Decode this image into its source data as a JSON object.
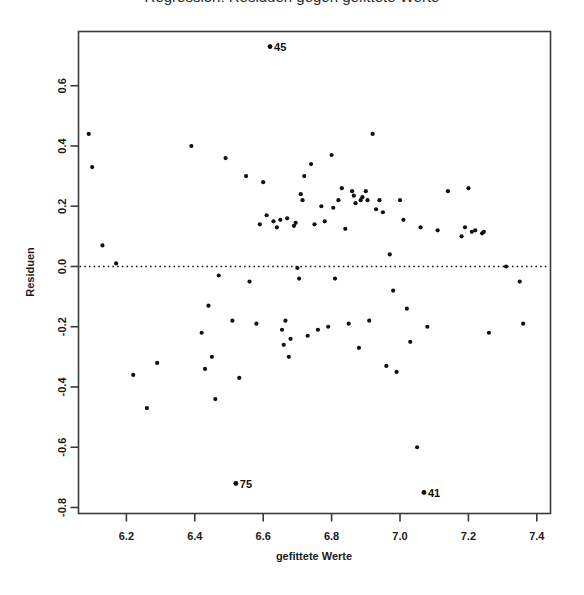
{
  "figure": {
    "title_partial": "Regression: Residuen gegen gefittete Werte",
    "title_cropped": true,
    "background_color": "#ffffff",
    "frame_color": "#3a3a3a",
    "point_color": "#111111",
    "refline_color": "#1a1a1a"
  },
  "chart_data": {
    "type": "scatter",
    "title": "Regression: Residuen gegen gefittete Werte",
    "xlabel": "gefittete Werte",
    "ylabel": "Residuen",
    "xlim": [
      6.06,
      7.44
    ],
    "ylim": [
      -0.82,
      0.78
    ],
    "xticks": [
      6.2,
      6.4,
      6.6,
      6.8,
      7.0,
      7.2,
      7.4
    ],
    "xtick_labels": [
      "6.2",
      "6.4",
      "6.6",
      "6.8",
      "7.0",
      "7.2",
      "7.4"
    ],
    "yticks": [
      0.6,
      0.4,
      0.2,
      0.0,
      -0.2,
      -0.4,
      -0.6,
      -0.8
    ],
    "ytick_labels": [
      "0.6",
      "0.4",
      "0.2",
      "0.0",
      "-0.2",
      "-0.4",
      "-0.6",
      "-0.8"
    ],
    "grid": false,
    "legend": null,
    "reference_lines": [
      {
        "axis": "horizontal",
        "value": 0.0,
        "style": "dotted"
      }
    ],
    "annotations": [
      {
        "label": "45",
        "x": 6.62,
        "y": 0.73
      },
      {
        "label": "75",
        "x": 6.52,
        "y": -0.72
      },
      {
        "label": "41",
        "x": 7.07,
        "y": -0.75
      }
    ],
    "x": [
      6.09,
      6.1,
      6.13,
      6.17,
      6.22,
      6.26,
      6.29,
      6.39,
      6.42,
      6.43,
      6.44,
      6.45,
      6.46,
      6.47,
      6.49,
      6.51,
      6.52,
      6.53,
      6.55,
      6.56,
      6.58,
      6.59,
      6.6,
      6.61,
      6.62,
      6.63,
      6.64,
      6.65,
      6.655,
      6.66,
      6.665,
      6.67,
      6.675,
      6.68,
      6.69,
      6.695,
      6.7,
      6.705,
      6.71,
      6.715,
      6.72,
      6.73,
      6.74,
      6.75,
      6.76,
      6.77,
      6.78,
      6.79,
      6.8,
      6.805,
      6.81,
      6.82,
      6.83,
      6.84,
      6.85,
      6.86,
      6.865,
      6.87,
      6.88,
      6.885,
      6.89,
      6.9,
      6.905,
      6.91,
      6.92,
      6.93,
      6.94,
      6.95,
      6.96,
      6.97,
      6.98,
      6.99,
      7.0,
      7.01,
      7.02,
      7.03,
      7.05,
      7.06,
      7.07,
      7.08,
      7.11,
      7.14,
      7.18,
      7.19,
      7.2,
      7.21,
      7.22,
      7.24,
      7.245,
      7.26,
      7.31,
      7.35,
      7.36
    ],
    "y": [
      0.44,
      0.33,
      0.07,
      0.01,
      -0.36,
      -0.47,
      -0.32,
      0.4,
      -0.22,
      -0.34,
      -0.13,
      -0.3,
      -0.44,
      -0.03,
      0.36,
      -0.18,
      -0.72,
      -0.37,
      0.3,
      -0.05,
      -0.19,
      0.14,
      0.28,
      0.17,
      0.73,
      0.15,
      0.13,
      0.155,
      -0.21,
      -0.26,
      -0.18,
      0.16,
      -0.3,
      -0.24,
      0.135,
      0.145,
      -0.005,
      -0.04,
      0.24,
      0.22,
      0.3,
      -0.23,
      0.34,
      0.14,
      -0.21,
      0.2,
      0.15,
      -0.2,
      0.37,
      0.195,
      -0.04,
      0.22,
      0.26,
      0.125,
      -0.19,
      0.25,
      0.235,
      0.21,
      -0.27,
      0.22,
      0.23,
      0.25,
      0.22,
      -0.18,
      0.44,
      0.19,
      0.22,
      0.18,
      -0.33,
      0.04,
      -0.08,
      -0.35,
      0.22,
      0.155,
      -0.14,
      -0.25,
      -0.6,
      0.13,
      -0.75,
      -0.2,
      0.12,
      0.25,
      0.1,
      0.13,
      0.26,
      0.115,
      0.12,
      0.11,
      0.115,
      -0.22,
      0.0,
      -0.05,
      -0.19
    ]
  }
}
